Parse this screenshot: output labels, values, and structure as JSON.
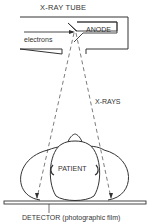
{
  "diagram": {
    "title": "X-RAY TUBE",
    "labels": {
      "anode": "ANODE",
      "electrons": "electrons",
      "xrays": "X-RAYS",
      "patient": "PATIENT",
      "detector": "DETECTOR (photographic film)"
    },
    "colors": {
      "stroke": "#333333",
      "background": "#ffffff"
    }
  }
}
